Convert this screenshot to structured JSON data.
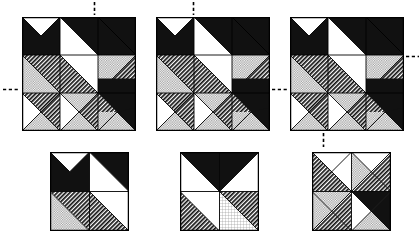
{
  "figure": {
    "background_color": "#ffffff",
    "ink_color": "#000000",
    "fills": {
      "white": "#ffffff",
      "black": "#1a1a1a",
      "dark_hatch": "#2b2b2b",
      "light_dot": "#c9c9c9",
      "grid": "#d8d8d8"
    },
    "rows": 2,
    "columns": 3,
    "block_count": 6
  },
  "blocks": [
    {
      "id": "block-top-left",
      "name": "Top-left large block",
      "x": 22,
      "y": 17,
      "size": 114,
      "grid": "3x3",
      "markers": [
        "vertical-dash-top",
        "horizontal-dash-left"
      ]
    },
    {
      "id": "block-top-center",
      "name": "Top-center large block",
      "x": 156,
      "y": 17,
      "size": 114,
      "grid": "3x3",
      "markers": [
        "vertical-dash-top",
        "horizontal-dash-right"
      ]
    },
    {
      "id": "block-top-right",
      "name": "Top-right large block",
      "x": 290,
      "y": 17,
      "size": 114,
      "grid": "3x3",
      "markers": [
        "horizontal-dash-right-upper",
        "vertical-dash-bottom"
      ]
    },
    {
      "id": "block-bottom-left",
      "name": "Bottom-left small block",
      "x": 50,
      "y": 152,
      "size": 79,
      "grid": "2x2",
      "markers": []
    },
    {
      "id": "block-bottom-center",
      "name": "Bottom-center small block",
      "x": 180,
      "y": 152,
      "size": 79,
      "grid": "2x2",
      "markers": []
    },
    {
      "id": "block-bottom-right",
      "name": "Bottom-right small block",
      "x": 312,
      "y": 152,
      "size": 79,
      "grid": "2x2",
      "markers": []
    }
  ],
  "markers": [
    {
      "id": "marker-1",
      "name": "vertical dash above top-left block",
      "x": 93,
      "y": 2,
      "orientation": "vertical",
      "length": 13
    },
    {
      "id": "marker-2",
      "name": "horizontal dash left of top-left block",
      "x": 3,
      "y": 88,
      "orientation": "horizontal",
      "length": 16
    },
    {
      "id": "marker-3",
      "name": "vertical dash above top-center block",
      "x": 192,
      "y": 2,
      "orientation": "vertical",
      "length": 13
    },
    {
      "id": "marker-4",
      "name": "horizontal dash right of top-center block",
      "x": 272,
      "y": 88,
      "orientation": "horizontal",
      "length": 16
    },
    {
      "id": "marker-5",
      "name": "horizontal dash right of top-right block",
      "x": 406,
      "y": 55,
      "orientation": "horizontal",
      "length": 13
    },
    {
      "id": "marker-6",
      "name": "vertical dash below top-right block",
      "x": 322,
      "y": 133,
      "orientation": "vertical",
      "length": 14
    }
  ],
  "patches": {
    "legend": [
      {
        "code": "W",
        "label": "white / background patch"
      },
      {
        "code": "K",
        "label": "solid black patch"
      },
      {
        "code": "H",
        "label": "dark diagonal hatch patch"
      },
      {
        "code": "D",
        "label": "light dotted patch"
      },
      {
        "code": "G",
        "label": "light grid patch"
      }
    ]
  }
}
